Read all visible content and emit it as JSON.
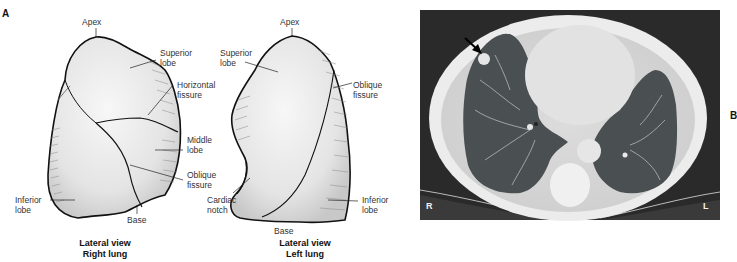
{
  "panel_a": {
    "letter": "A",
    "right_lung": {
      "labels": {
        "apex": "Apex",
        "superior_lobe": "Superior\nlobe",
        "horizontal_fissure": "Horizontal\nfissure",
        "middle_lobe": "Middle\nlobe",
        "oblique_fissure": "Oblique\nfissure",
        "inferior_lobe": "Inferior\nlobe",
        "base": "Base"
      },
      "caption": "Lateral view\nRight lung"
    },
    "left_lung": {
      "labels": {
        "apex": "Apex",
        "superior_lobe": "Superior\nlobe",
        "oblique_fissure": "Oblique\nfissure",
        "cardiac_notch": "Cardiac\nnotch",
        "inferior_lobe": "Inferior\nlobe",
        "base": "Base"
      },
      "caption": "Lateral view\nLeft lung"
    }
  },
  "panel_b": {
    "letter": "B",
    "ct_markers": {
      "right": "R",
      "left": "L"
    },
    "annotation": "arrow-pointing-to-nodule"
  }
}
